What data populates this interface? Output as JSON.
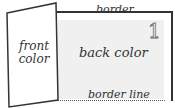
{
  "diagram": {
    "labels": {
      "border": "border",
      "back_color": "back color",
      "border_line": "border line",
      "front_color_line1": "front",
      "front_color_line2": "color",
      "page_number": "1"
    },
    "colors": {
      "outline": "#333333",
      "back_fill": "#f0f0f0",
      "front_fill": "#ffffff"
    }
  }
}
